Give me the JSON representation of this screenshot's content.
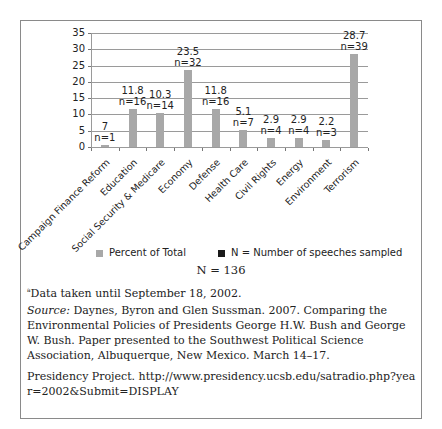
{
  "chart_data": {
    "type": "bar",
    "title": "",
    "xlabel": "",
    "ylabel": "",
    "ylim": [
      0,
      35
    ],
    "yticks": [
      0,
      5,
      10,
      15,
      20,
      25,
      30,
      35
    ],
    "grid": true,
    "categories": [
      "Campaign Finance Reform",
      "Education",
      "Social Security & Medicare",
      "Economy",
      "Defense",
      "Health Care",
      "Civil Rights",
      "Energy",
      "Environment",
      "Terrorism"
    ],
    "series": [
      {
        "name": "Percent of Total",
        "values": [
          0.7,
          11.8,
          10.3,
          23.5,
          11.8,
          5.1,
          2.9,
          2.9,
          2.2,
          28.7
        ],
        "color": "#a8a8a8"
      },
      {
        "name": "N = Number of speeches sampled",
        "values": [
          1,
          16,
          14,
          32,
          16,
          7,
          4,
          4,
          3,
          39
        ],
        "color": "#1a1a1a"
      }
    ],
    "data_labels": [
      {
        "value": "7",
        "n": "n=1"
      },
      {
        "value": "11.8",
        "n": "n=16"
      },
      {
        "value": "10.3",
        "n": "n=14"
      },
      {
        "value": "23.5",
        "n": "n=32"
      },
      {
        "value": "11.8",
        "n": "n=16"
      },
      {
        "value": "5.1",
        "n": "n=7"
      },
      {
        "value": "2.9",
        "n": "n=4"
      },
      {
        "value": "2.9",
        "n": "n=4"
      },
      {
        "value": "2.2",
        "n": "n=3"
      },
      {
        "value": "28.7",
        "n": "n=39"
      }
    ],
    "legend": [
      "Percent of Total",
      "N = Number of speeches sampled"
    ],
    "legend_position": "bottom"
  },
  "total": "N = 136",
  "footnote": "Data taken until September 18, 2002.",
  "footnote_marker": "a",
  "source_label": "Source:",
  "source_text": " Daynes, Byron and Glen Sussman. 2007. Comparing the Environmental Policies of Presidents George H.W. Bush and George W. Bush. Paper presented to the Southwest Political Science Association, Albuquerque, New Mexico. March 14–17.",
  "presidency": "Presidency Project. http://www.presidency.ucsb.edu/satradio.php?year=2002&Submit=DISPLAY"
}
